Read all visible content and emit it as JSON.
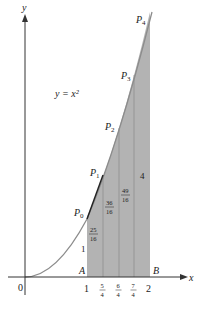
{
  "diagram": {
    "equation": "y = x²",
    "axes": {
      "x_label": "x",
      "y_label": "y",
      "origin_label": "0"
    },
    "points": [
      "P0",
      "P1",
      "P2",
      "P3",
      "P4"
    ],
    "endpoints": {
      "A": "A",
      "B": "B"
    },
    "x_ticks": [
      {
        "value": 1,
        "label": "1"
      },
      {
        "value": 1.25,
        "num": "5",
        "den": "4"
      },
      {
        "value": 1.5,
        "num": "6",
        "den": "4"
      },
      {
        "value": 1.75,
        "num": "7",
        "den": "4"
      },
      {
        "value": 2,
        "label": "2"
      }
    ],
    "strip_heights": [
      {
        "label": "1"
      },
      {
        "num": "25",
        "den": "16"
      },
      {
        "num": "36",
        "den": "16"
      },
      {
        "num": "49",
        "den": "16"
      },
      {
        "label": "4"
      }
    ],
    "colors": {
      "shade": "#b3b3b3",
      "curve": "#8c8c8c",
      "axis": "#333333",
      "strip_line": "#8a8a8a"
    }
  }
}
